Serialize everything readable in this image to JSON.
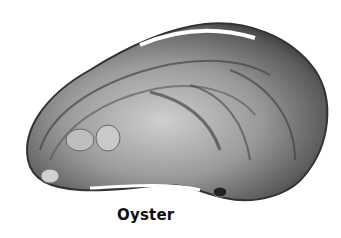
{
  "figure": {
    "caption": "Oyster",
    "colors": {
      "background": "#ffffff",
      "shell_dark": "#3a3a3a",
      "shell_mid": "#8a8a8a",
      "shell_light": "#d8d8d8",
      "caption_text": "#111111"
    }
  }
}
